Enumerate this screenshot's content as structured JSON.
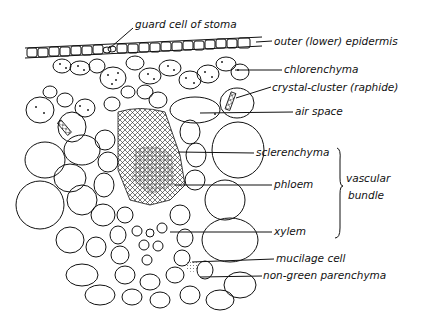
{
  "diagram": {
    "labels": {
      "guard_cell": "guard cell of stoma",
      "epidermis": "outer (lower) epidermis",
      "chlorenchyma": "chlorenchyma",
      "crystal": "crystal-cluster (raphide)",
      "air_space": "air space",
      "sclerenchyma": "sclerenchyma",
      "phloem": "phloem",
      "vascular_bundle_1": "vascular",
      "vascular_bundle_2": "bundle",
      "xylem": "xylem",
      "mucilage": "mucilage cell",
      "parenchyma": "non-green parenchyma"
    }
  }
}
